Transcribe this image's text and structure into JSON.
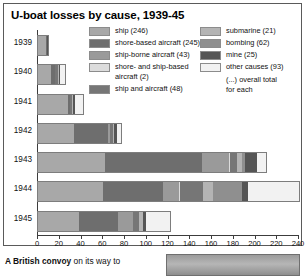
{
  "figure": {
    "title": "U-boat losses by cause, 1939-45"
  },
  "legend": {
    "left_items": [
      {
        "label": "ship (246)",
        "color": "#a8a8a8",
        "key": "ship"
      },
      {
        "label": "shore-based aircraft (245)",
        "color": "#6e6e6e",
        "key": "shore-based-aircraft"
      },
      {
        "label": "ship-borne aircraft (43)",
        "color": "#9a9a9a",
        "key": "ship-borne-aircraft"
      },
      {
        "label": "shore- and ship-based\naircraft (2)",
        "color": "#dcdcdc",
        "key": "shore-and-ship-based-aircraft"
      },
      {
        "label": "ship and aircraft (48)",
        "color": "#767676",
        "key": "ship-and-aircraft"
      }
    ],
    "right_items": [
      {
        "label": "submarine (21)",
        "color": "#b4b4b4",
        "key": "submarine"
      },
      {
        "label": "bombing (62)",
        "color": "#8f8f8f",
        "key": "bombing"
      },
      {
        "label": "mine (25)",
        "color": "#555555",
        "key": "mine"
      },
      {
        "label": "other causes (93)",
        "color": "#f2f2f2",
        "key": "other-causes"
      }
    ],
    "note": "(...) overall total\nfor each"
  },
  "chart_data": {
    "type": "bar",
    "orientation": "horizontal",
    "stacked": true,
    "title": "U-boat losses by cause, 1939-45",
    "xlabel": "",
    "ylabel": "",
    "xlim": [
      0,
      240
    ],
    "xticks": [
      0,
      20,
      40,
      60,
      80,
      100,
      120,
      140,
      160,
      180,
      200,
      220,
      240
    ],
    "grid": false,
    "legend_position": "top",
    "categories": [
      "1939",
      "1940",
      "1941",
      "1942",
      "1943",
      "1944",
      "1945"
    ],
    "series": [
      {
        "name": "ship",
        "color": "#a8a8a8",
        "values": [
          7,
          12,
          28,
          33,
          62,
          60,
          38
        ]
      },
      {
        "name": "shore-based aircraft",
        "color": "#6e6e6e",
        "values": [
          1,
          4,
          1,
          31,
          89,
          55,
          36
        ]
      },
      {
        "name": "ship-borne aircraft",
        "color": "#9a9a9a",
        "values": [
          0,
          0,
          0,
          2,
          25,
          15,
          13
        ]
      },
      {
        "name": "shore- and ship-based aircraft",
        "color": "#dcdcdc",
        "values": [
          0,
          0,
          0,
          0,
          1,
          1,
          0
        ]
      },
      {
        "name": "ship and aircraft",
        "color": "#767676",
        "values": [
          0,
          2,
          2,
          3,
          6,
          21,
          6
        ]
      },
      {
        "name": "submarine",
        "color": "#b4b4b4",
        "values": [
          0,
          1,
          1,
          1,
          5,
          9,
          4
        ]
      },
      {
        "name": "bombing",
        "color": "#8f8f8f",
        "values": [
          0,
          0,
          0,
          0,
          2,
          27,
          0
        ]
      },
      {
        "name": "mine",
        "color": "#555555",
        "values": [
          1,
          1,
          2,
          3,
          11,
          5,
          2
        ]
      },
      {
        "name": "other causes",
        "color": "#f2f2f2",
        "values": [
          0,
          5,
          7,
          3,
          9,
          47,
          22
        ]
      }
    ],
    "totals": [
      9,
      25,
      41,
      76,
      210,
      240,
      121
    ],
    "overall_totals": {
      "ship": 246,
      "shore-based aircraft": 245,
      "ship-borne aircraft": 43,
      "shore- and ship-based aircraft": 2,
      "ship and aircraft": 48,
      "submarine": 21,
      "bombing": 62,
      "mine": 25,
      "other causes": 93
    }
  },
  "caption": {
    "bold": "A British convoy",
    "rest": " on its way to"
  }
}
